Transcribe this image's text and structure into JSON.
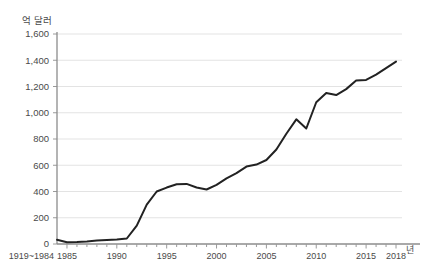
{
  "chart_data": {
    "type": "line",
    "title": "",
    "subtitle": "",
    "xlabel": "년",
    "ylabel": "억 달러",
    "ylim": [
      0,
      1600
    ],
    "grid": true,
    "legend": null,
    "y_ticks": [
      "0",
      "200",
      "400",
      "600",
      "800",
      "1,000",
      "1,200",
      "1,400",
      "1,600"
    ],
    "y_tick_values": [
      0,
      200,
      400,
      600,
      800,
      1000,
      1200,
      1400,
      1600
    ],
    "x_ticks": [
      "1919~1984",
      "1985",
      "1990",
      "1995",
      "2000",
      "2005",
      "2010",
      "2015",
      "2018"
    ],
    "x_tick_values": [
      1984,
      1985,
      1990,
      1995,
      2000,
      2005,
      2010,
      2015,
      2018
    ],
    "x_first_label": "1919~1984",
    "series": [
      {
        "name": "",
        "color": "#222222",
        "x": [
          1984,
          1985,
          1986,
          1987,
          1988,
          1989,
          1990,
          1991,
          1992,
          1993,
          1994,
          1995,
          1996,
          1997,
          1998,
          1999,
          2000,
          2001,
          2002,
          2003,
          2004,
          2005,
          2006,
          2007,
          2008,
          2009,
          2010,
          2011,
          2012,
          2013,
          2014,
          2015,
          2016,
          2017,
          2018
        ],
        "values": [
          32,
          14,
          16,
          20,
          26,
          30,
          35,
          42,
          140,
          300,
          400,
          430,
          455,
          458,
          430,
          415,
          450,
          500,
          540,
          590,
          605,
          640,
          720,
          840,
          950,
          880,
          1080,
          1150,
          1135,
          1180,
          1245,
          1250,
          1290,
          1340,
          1390
        ]
      }
    ]
  }
}
